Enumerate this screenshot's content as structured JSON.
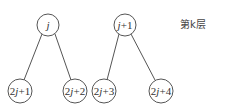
{
  "diagram": {
    "type": "binary-tree-fragment",
    "level_label": "第k层",
    "nodes": [
      {
        "id": "j",
        "label": "j",
        "italic_parts": [
          "j"
        ]
      },
      {
        "id": "j1",
        "label": "j+1"
      },
      {
        "id": "c1",
        "label": "2j+1"
      },
      {
        "id": "c2",
        "label": "2j+2"
      },
      {
        "id": "c3",
        "label": "2j+3"
      },
      {
        "id": "c4",
        "label": "2j+4"
      }
    ],
    "edges": [
      {
        "from": "j",
        "to": "c1"
      },
      {
        "from": "j",
        "to": "c2"
      },
      {
        "from": "j1",
        "to": "c3"
      },
      {
        "from": "j1",
        "to": "c4"
      }
    ]
  }
}
